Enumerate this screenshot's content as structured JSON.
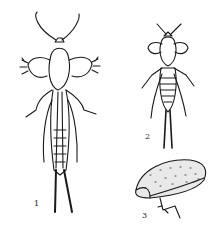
{
  "figure": {
    "type": "scientific-illustration",
    "panels": [
      {
        "id": "1",
        "label": "1",
        "description": "adult, dorsal view"
      },
      {
        "id": "2",
        "label": "2",
        "description": "nymph, dorsal view"
      },
      {
        "id": "3",
        "label": "3",
        "description": "egg mass / chamber with leg"
      }
    ],
    "colors": {
      "ink": "#1a1a1a",
      "paper": "#ffffff"
    }
  }
}
